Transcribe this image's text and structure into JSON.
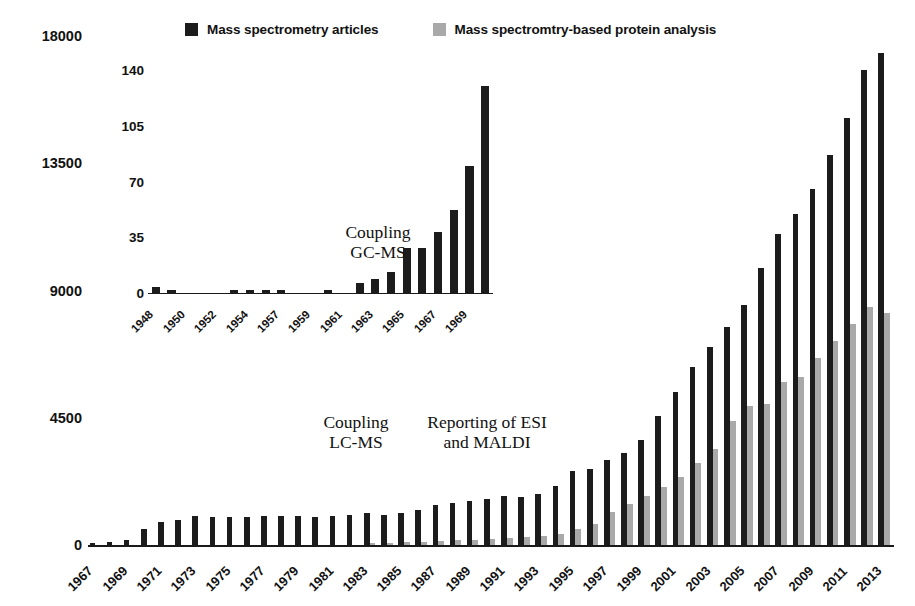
{
  "legend": {
    "entries": [
      {
        "label": "Mass spectrometry articles",
        "color": "#1c1c1c",
        "swatch_name": "legend-swatch-dark"
      },
      {
        "label": "Mass spectromtry-based protein analysis",
        "color": "#a9a9a9",
        "swatch_name": "legend-swatch-gray"
      }
    ]
  },
  "annotations": [
    {
      "id": "gcms",
      "text": "Coupling\nGC-MS"
    },
    {
      "id": "lcms",
      "text": "Coupling\nLC-MS"
    },
    {
      "id": "esi",
      "text": "Reporting of ESI\nand MALDI"
    }
  ],
  "chart_data": [
    {
      "id": "main",
      "type": "bar",
      "title": "",
      "xlabel": "",
      "ylabel": "",
      "ylim": [
        0,
        18000
      ],
      "yticks": [
        0,
        4500,
        9000,
        13500,
        18000
      ],
      "ytick_labels": [
        "0",
        "4500",
        "9000",
        "13500",
        "18000"
      ],
      "grid": false,
      "legend_position": "top",
      "categories": [
        "1967",
        "1968",
        "1969",
        "1970",
        "1971",
        "1972",
        "1973",
        "1974",
        "1975",
        "1976",
        "1977",
        "1978",
        "1979",
        "1980",
        "1981",
        "1982",
        "1983",
        "1984",
        "1985",
        "1986",
        "1987",
        "1988",
        "1989",
        "1990",
        "1991",
        "1992",
        "1993",
        "1994",
        "1995",
        "1996",
        "1997",
        "1998",
        "1999",
        "2000",
        "2001",
        "2002",
        "2003",
        "2004",
        "2005",
        "2006",
        "2007",
        "2008",
        "2009",
        "2010",
        "2011",
        "2012",
        "2013"
      ],
      "tick_labels_shown": [
        "1967",
        "1969",
        "1971",
        "1973",
        "1975",
        "1977",
        "1979",
        "1981",
        "1983",
        "1985",
        "1987",
        "1989",
        "1991",
        "1993",
        "1995",
        "1997",
        "1999",
        "2001",
        "2003",
        "2005",
        "2007",
        "2009",
        "2011",
        "2013"
      ],
      "series": [
        {
          "name": "Mass spectrometry articles",
          "color": "#1c1c1c",
          "values": [
            60,
            110,
            180,
            560,
            800,
            880,
            1040,
            1000,
            980,
            1000,
            1020,
            1010,
            1020,
            1000,
            1010,
            1050,
            1130,
            1060,
            1140,
            1230,
            1400,
            1500,
            1570,
            1640,
            1720,
            1700,
            1800,
            2100,
            2600,
            2700,
            3000,
            3250,
            3700,
            4550,
            5400,
            6300,
            7000,
            7700,
            8500,
            9800,
            11000,
            11700,
            12600,
            13800,
            15100,
            16800,
            17400
          ]
        },
        {
          "name": "Mass spectromtry-based protein analysis",
          "color": "#a9a9a9",
          "values": [
            0,
            0,
            0,
            0,
            0,
            0,
            0,
            0,
            0,
            0,
            0,
            0,
            0,
            0,
            0,
            0,
            60,
            70,
            90,
            110,
            140,
            170,
            190,
            210,
            240,
            270,
            330,
            400,
            560,
            760,
            1150,
            1450,
            1750,
            2050,
            2400,
            2900,
            3400,
            4400,
            4900,
            5000,
            5750,
            5950,
            6600,
            7200,
            7800,
            8400,
            8200
          ]
        }
      ]
    },
    {
      "id": "inset",
      "type": "bar",
      "title": "",
      "xlabel": "",
      "ylabel": "",
      "ylim": [
        0,
        140
      ],
      "yticks": [
        0,
        35,
        70,
        105,
        140
      ],
      "ytick_labels": [
        "0",
        "35",
        "70",
        "105",
        "140"
      ],
      "grid": false,
      "legend_position": "none",
      "categories": [
        "1948",
        "1949",
        "1950",
        "1951",
        "1952",
        "1953",
        "1954",
        "1955",
        "1957",
        "1958",
        "1959",
        "1960",
        "1961",
        "1962",
        "1963",
        "1964",
        "1965",
        "1966",
        "1967",
        "1968",
        "1969"
      ],
      "tick_labels_shown": [
        "1948",
        "1950",
        "1952",
        "1954",
        "1957",
        "1959",
        "1961",
        "1963",
        "1965",
        "1967",
        "1969"
      ],
      "series": [
        {
          "name": "Mass spectrometry articles",
          "color": "#1c1c1c",
          "values": [
            4,
            2,
            0,
            0,
            0,
            2,
            2,
            2,
            2,
            0,
            0,
            2,
            0,
            6,
            9,
            13,
            28,
            28,
            38,
            52,
            80,
            130
          ]
        }
      ]
    }
  ]
}
